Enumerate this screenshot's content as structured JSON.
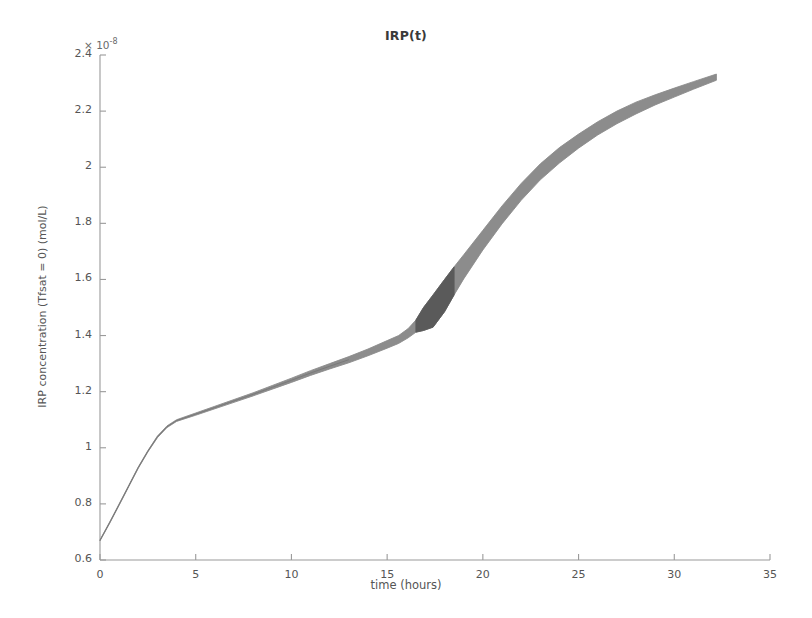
{
  "chart_data": {
    "type": "area",
    "title": "IRP(t)",
    "xlabel": "time (hours)",
    "ylabel": "IRP concentration (Tfsat = 0) (mol/L)",
    "y_exponent_prefix": "× 10",
    "y_exponent_value": "-8",
    "y_scale_factor": 1e-08,
    "xlim": [
      0,
      35
    ],
    "ylim": [
      0.6,
      2.4
    ],
    "xticks": [
      0,
      5,
      10,
      15,
      20,
      25,
      30,
      35
    ],
    "yticks": [
      0.6,
      0.8,
      1,
      1.2,
      1.4,
      1.6,
      1.8,
      2,
      2.2,
      2.4
    ],
    "xtick_labels": [
      "0",
      "5",
      "10",
      "15",
      "20",
      "25",
      "30",
      "35"
    ],
    "ytick_labels": [
      "0.6",
      "0.8",
      "1",
      "1.2",
      "1.4",
      "1.6",
      "1.8",
      "2",
      "2.2",
      "2.4"
    ],
    "grid": false,
    "legend": false,
    "band_color": "#8c8c8c",
    "band_dark_color": "#5a5a5a",
    "line_color": "#7a7a7a",
    "axis_color": "#9a9a9a",
    "x": [
      0,
      0.5,
      1,
      1.5,
      2,
      2.5,
      3,
      3.5,
      4,
      5,
      6,
      7,
      8,
      9,
      10,
      11,
      12,
      13,
      14,
      15,
      15.6,
      16.1,
      16.5,
      16.9,
      17.4,
      18,
      18.5,
      19,
      20,
      21,
      22,
      23,
      24,
      25,
      26,
      27,
      28,
      29,
      30,
      31,
      32.2
    ],
    "series": [
      {
        "name": "upper bound",
        "values": [
          0.672,
          0.735,
          0.8,
          0.866,
          0.932,
          0.99,
          1.042,
          1.078,
          1.1,
          1.124,
          1.148,
          1.172,
          1.196,
          1.222,
          1.248,
          1.275,
          1.3,
          1.325,
          1.352,
          1.382,
          1.4,
          1.425,
          1.455,
          1.5,
          1.545,
          1.6,
          1.645,
          1.688,
          1.775,
          1.862,
          1.942,
          2.012,
          2.07,
          2.118,
          2.162,
          2.2,
          2.232,
          2.258,
          2.282,
          2.305,
          2.332
        ]
      },
      {
        "name": "lower bound",
        "values": [
          0.668,
          0.73,
          0.795,
          0.861,
          0.927,
          0.985,
          1.036,
          1.072,
          1.094,
          1.116,
          1.139,
          1.162,
          1.185,
          1.209,
          1.233,
          1.258,
          1.281,
          1.303,
          1.328,
          1.355,
          1.372,
          1.392,
          1.412,
          1.418,
          1.43,
          1.485,
          1.545,
          1.602,
          1.705,
          1.798,
          1.882,
          1.955,
          2.015,
          2.068,
          2.115,
          2.155,
          2.19,
          2.222,
          2.25,
          2.278,
          2.31
        ]
      }
    ],
    "annotations": [
      {
        "label": "plateau-kink",
        "x": 16.5,
        "y": 1.42
      },
      {
        "label": "dark-segment-start",
        "x": 16.5,
        "y": 1.42
      },
      {
        "label": "dark-segment-end",
        "x": 18.5,
        "y": 1.6
      }
    ]
  }
}
